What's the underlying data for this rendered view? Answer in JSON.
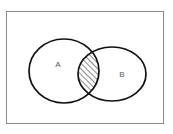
{
  "figure": {
    "kind": "venn-diagram",
    "background_color": "#ffffff",
    "stroke_color": "#111111",
    "label_color": "#5a5a5a",
    "hatch_color": "#1a1a1a"
  },
  "universe": {
    "name": "universal-set-rectangle",
    "border_color": "#8a8a8a",
    "x": 6,
    "y": 11,
    "width": 158,
    "height": 113
  },
  "sets": [
    {
      "id": "A",
      "label": "A",
      "label_x": 58,
      "label_y": 65,
      "cx": 64,
      "cy": 71,
      "rx": 35,
      "ry": 32
    },
    {
      "id": "B",
      "label": "B",
      "label_x": 122,
      "label_y": 75,
      "cx": 112,
      "cy": 74,
      "rx": 34,
      "ry": 27
    }
  ],
  "intersection": {
    "name": "A-intersect-B",
    "fill_pattern": "diagonal-hatch",
    "hatch_direction": "bottom-left-to-top-right",
    "hatch_spacing_px": 4,
    "hatch_line_width_px": 1
  }
}
